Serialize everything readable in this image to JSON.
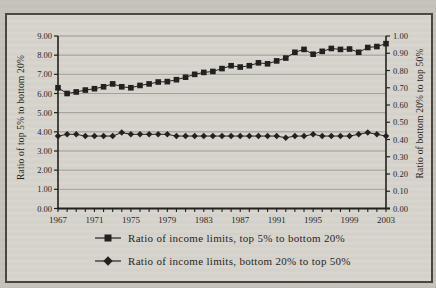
{
  "figure": {
    "background_color": "#c6c3bb",
    "frame_background": "#d8d5ce",
    "ink_color": "#1c1b19",
    "grid_color": "#8f8d87"
  },
  "axes": {
    "left": {
      "title": "Ratio of top 5% to bottom 20%",
      "tick_labels": [
        "9.00",
        "8.00",
        "7.00",
        "6.00",
        "5.00",
        "4.00",
        "3.00",
        "2.00",
        "1.00",
        "0.00"
      ],
      "min": 0,
      "max": 9,
      "step": 1
    },
    "right": {
      "title": "Ratio of bottom 20% to top 50%",
      "tick_labels": [
        "1.00",
        "0.90",
        "0.80",
        "0.70",
        "0.60",
        "0.50",
        "0.40",
        "0.30",
        "0.20",
        "0.10",
        "0.00"
      ],
      "min": 0,
      "max": 1,
      "step": 0.1
    },
    "x": {
      "tick_labels": [
        "1967",
        "1971",
        "1975",
        "1979",
        "1983",
        "1987",
        "1991",
        "1995",
        "1999",
        "2003"
      ],
      "label_interval_years": 4
    }
  },
  "legend": {
    "items": [
      {
        "label": "Ratio of income limits, top 5% to bottom 20%",
        "marker": "square"
      },
      {
        "label": "Ratio of income limits, bottom 20% to top 50%",
        "marker": "diamond"
      }
    ]
  },
  "chart_data": {
    "type": "line",
    "grid": true,
    "legend_position": "bottom",
    "left_ylim": [
      0,
      9
    ],
    "right_ylim": [
      0,
      1
    ],
    "x": [
      1967,
      1968,
      1969,
      1970,
      1971,
      1972,
      1973,
      1974,
      1975,
      1976,
      1977,
      1978,
      1979,
      1980,
      1981,
      1982,
      1983,
      1984,
      1985,
      1986,
      1987,
      1988,
      1989,
      1990,
      1991,
      1992,
      1993,
      1994,
      1995,
      1996,
      1997,
      1998,
      1999,
      2000,
      2001,
      2002,
      2003
    ],
    "series": [
      {
        "name": "Ratio of income limits, top 5% to bottom 20%",
        "axis": "left",
        "marker": "square",
        "values": [
          6.3,
          6.0,
          6.08,
          6.18,
          6.25,
          6.35,
          6.5,
          6.35,
          6.3,
          6.42,
          6.5,
          6.6,
          6.62,
          6.72,
          6.85,
          7.0,
          7.1,
          7.15,
          7.3,
          7.45,
          7.38,
          7.45,
          7.6,
          7.55,
          7.7,
          7.85,
          8.15,
          8.3,
          8.05,
          8.2,
          8.35,
          8.3,
          8.32,
          8.15,
          8.4,
          8.45,
          8.6
        ]
      },
      {
        "name": "Ratio of income limits, bottom 20% to top 50%",
        "axis": "right",
        "marker": "diamond",
        "values": [
          0.42,
          0.43,
          0.43,
          0.42,
          0.42,
          0.42,
          0.42,
          0.44,
          0.43,
          0.43,
          0.43,
          0.43,
          0.43,
          0.42,
          0.42,
          0.42,
          0.42,
          0.42,
          0.42,
          0.42,
          0.42,
          0.42,
          0.42,
          0.42,
          0.42,
          0.41,
          0.42,
          0.42,
          0.43,
          0.42,
          0.42,
          0.42,
          0.42,
          0.43,
          0.44,
          0.43,
          0.42
        ]
      }
    ]
  }
}
